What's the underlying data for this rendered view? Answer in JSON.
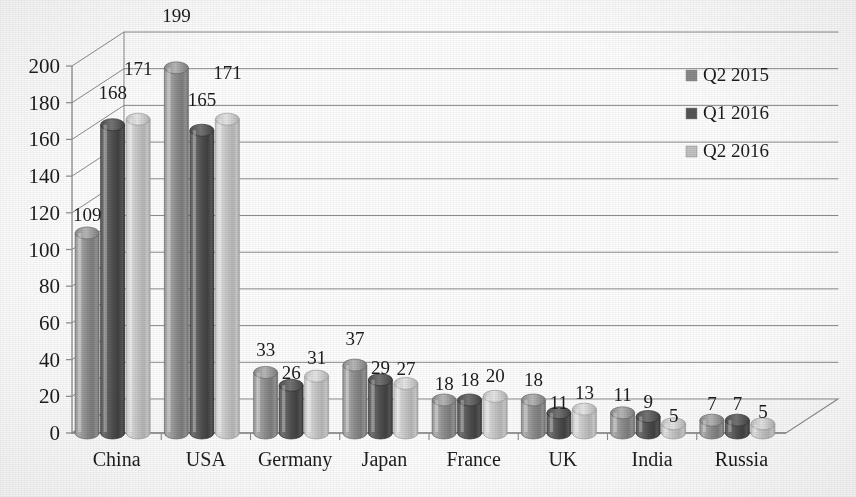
{
  "chart_data": {
    "type": "bar",
    "title": "",
    "subtitle": "",
    "xlabel": "",
    "ylabel": "",
    "categories": [
      "China",
      "USA",
      "Germany",
      "Japan",
      "France",
      "UK",
      "India",
      "Russia"
    ],
    "series": [
      {
        "name": "Q2 2015",
        "color": "#8a8a8a",
        "values": [
          109,
          199,
          33,
          37,
          18,
          18,
          11,
          7
        ]
      },
      {
        "name": "Q1 2016",
        "color": "#555555",
        "values": [
          168,
          165,
          26,
          29,
          18,
          11,
          9,
          7
        ]
      },
      {
        "name": "Q2 2016",
        "color": "#c2c2c2",
        "values": [
          171,
          171,
          31,
          27,
          20,
          13,
          5,
          5
        ]
      }
    ],
    "ylim": [
      0,
      200
    ],
    "ytick_values": [
      0,
      20,
      40,
      60,
      80,
      100,
      120,
      140,
      160,
      180,
      200
    ],
    "ytick_labels": [
      "0",
      "20",
      "40",
      "60",
      "80",
      "100",
      "120",
      "140",
      "160",
      "180",
      "200"
    ],
    "ytick_step": 20,
    "grid": true,
    "grid_axis": "y",
    "legend_position": "right",
    "data_labels": true,
    "style": "3d-cylinder",
    "background_color": "#ffffff",
    "axis_color": "#8c8c8c",
    "text_color": "#1c1c1c"
  },
  "legend": {
    "items": [
      {
        "label": "Q2 2015",
        "swatch_color": "#8a8a8a"
      },
      {
        "label": "Q1 2016",
        "swatch_color": "#555555"
      },
      {
        "label": "Q2 2016",
        "swatch_color": "#c2c2c2"
      }
    ]
  }
}
